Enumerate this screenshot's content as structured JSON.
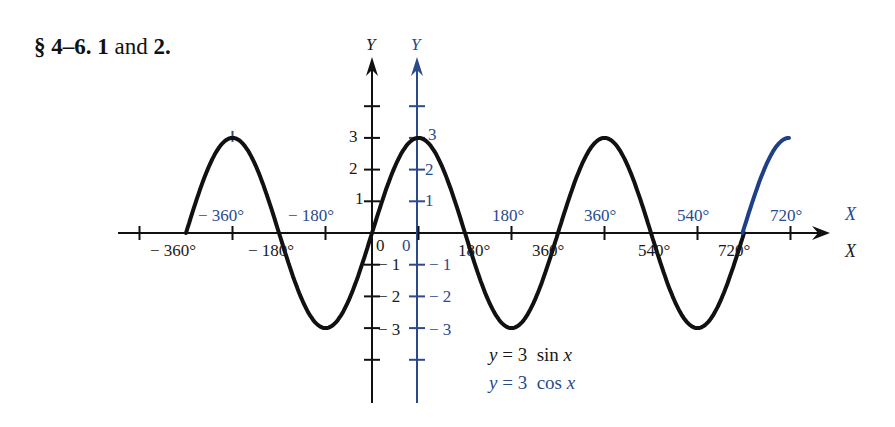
{
  "heading": {
    "section": "§ 4–6.",
    "num1": "1",
    "and": "and",
    "num2": "2."
  },
  "colors": {
    "black_curve": "#111111",
    "blue_curve": "#1f3f86",
    "background": "#ffffff"
  },
  "chart_data": {
    "type": "line",
    "title": "§ 4–6. 1 and 2.",
    "xlabel": "X",
    "ylabel": "Y",
    "grid": false,
    "series": [
      {
        "name": "y = 3 sin x",
        "color": "#111111",
        "axis": "black",
        "function": "3*sin(x)",
        "x_range_deg": [
          -360,
          720
        ],
        "x": [
          -360,
          -270,
          -180,
          -90,
          0,
          90,
          180,
          270,
          360,
          450,
          540,
          630,
          720
        ],
        "y": [
          0,
          3,
          0,
          -3,
          0,
          3,
          0,
          -3,
          0,
          3,
          0,
          -3,
          0
        ]
      },
      {
        "name": "y = 3 cos x",
        "color": "#1f3f86",
        "axis": "blue",
        "function": "3*cos(x)",
        "x_range_deg": [
          630,
          720
        ],
        "x": [
          630,
          675,
          720
        ],
        "y": [
          0,
          2.12,
          3
        ]
      }
    ],
    "black_axis": {
      "x_ticks_below": [
        "−360°",
        "−180°",
        "0",
        "180°",
        "360°",
        "540°",
        "720°"
      ],
      "x_tick_values": [
        -360,
        -180,
        0,
        180,
        360,
        540,
        720
      ],
      "y_ticks": [
        "3",
        "2",
        "1",
        "−1",
        "−2",
        "−3"
      ],
      "y_tick_values": [
        3,
        2,
        1,
        -1,
        -2,
        -3
      ],
      "x_label": "X",
      "y_label": "Y"
    },
    "blue_axis": {
      "x_ticks_above": [
        "−360°",
        "−180°",
        "0",
        "180°",
        "360°",
        "540°",
        "720°"
      ],
      "x_tick_values": [
        -360,
        -180,
        0,
        180,
        360,
        540,
        720
      ],
      "y_ticks": [
        "3",
        "2",
        "1",
        "−1",
        "−2",
        "−3"
      ],
      "y_tick_values": [
        3,
        2,
        1,
        -1,
        -2,
        -3
      ],
      "x_label": "X",
      "y_label": "Y"
    },
    "ylim": [
      -4,
      4
    ],
    "xlim_deg": [
      -400,
      790
    ],
    "legend": [
      "y = 3 sin x",
      "y = 3 cos x"
    ],
    "legend_position": "lower center"
  },
  "labels": {
    "black_y": "Y",
    "blue_y": "Y",
    "black_x": "X",
    "blue_x": "X",
    "black_x_ticks": [
      "− 360°",
      "− 180°",
      "180°",
      "360°",
      "540°",
      "720°"
    ],
    "blue_x_ticks": [
      "− 360°",
      "− 180°",
      "180°",
      "360°",
      "540°",
      "720°"
    ],
    "black_zero": "0",
    "blue_zero": "0",
    "black_y_pos": [
      "3",
      "2",
      "1"
    ],
    "black_y_neg": [
      "− 1",
      "− 2",
      "− 3"
    ],
    "blue_y_pos": [
      "3",
      "2",
      "1"
    ],
    "blue_y_neg": [
      "− 1",
      "− 2",
      "− 3"
    ]
  },
  "legend": {
    "sin": {
      "lhs": "y",
      "eq": " = 3  sin ",
      "var": "x"
    },
    "cos": {
      "lhs": "y",
      "eq": " = 3  cos ",
      "var": "x"
    }
  }
}
